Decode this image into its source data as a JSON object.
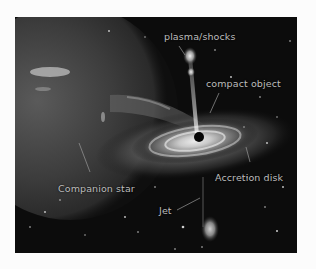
{
  "diagram": {
    "labels": {
      "plasma": "plasma/shocks",
      "compact": "compact object",
      "disk": "Accretion disk",
      "star": "Companion star",
      "jet": "Jet"
    },
    "colors": {
      "background": "#0c0c0c",
      "label_text": "#bdbdbd",
      "page": "#fcfcfc"
    }
  }
}
